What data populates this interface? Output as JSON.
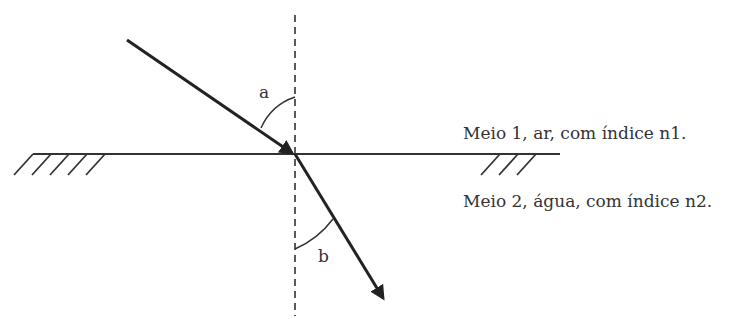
{
  "diagram": {
    "type": "refraction",
    "angle_labels": {
      "incidence": "a",
      "refraction": "b"
    },
    "media": [
      {
        "label": "Meio 1, ar, com índice n1."
      },
      {
        "label": "Meio 2, água, com índice n2."
      }
    ],
    "colors": {
      "line": "#222222",
      "text": "#333333",
      "background": "#ffffff"
    }
  }
}
